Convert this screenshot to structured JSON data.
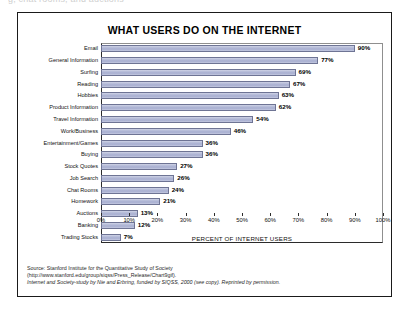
{
  "page": {
    "top_cut_text": "g, chat rooms, and auctions"
  },
  "figure": {
    "title": "WHAT USERS DO ON THE INTERNET",
    "x_axis_title": "PERCENT OF INTERNET USERS",
    "source_lines": [
      "Source: Stanford Institute for the Quantitative Study of Society",
      "(http://www.stanford.edu/group/siqss/Press_Release/Chart9gif).",
      "Internet and Society-study by Nie and Erbring, funded by SIQSS, 2000 (see copy). Reprinted by permission."
    ],
    "colors": {
      "bar_fill": "#a7aed0",
      "bar_border": "#6e7494",
      "frame": "#1a1a1a",
      "axis": "#2b2b2b"
    }
  },
  "chart_data": {
    "type": "bar",
    "orientation": "horizontal",
    "title": "WHAT USERS DO ON THE INTERNET",
    "xlabel": "PERCENT OF INTERNET USERS",
    "ylabel": "",
    "xlim": [
      0,
      100
    ],
    "xticks": [
      "0%",
      "10%",
      "20%",
      "30%",
      "40%",
      "50%",
      "60%",
      "70%",
      "80%",
      "90%",
      "100%"
    ],
    "grid": false,
    "legend": null,
    "value_suffix": "%",
    "categories": [
      "Email",
      "General Information",
      "Surfing",
      "Reading",
      "Hobbies",
      "Product Information",
      "Travel Information",
      "Work/Business",
      "Entertainment/Games",
      "Buying",
      "Stock Quotes",
      "Job Search",
      "Chat Rooms",
      "Homework",
      "Auctions",
      "Banking",
      "Trading Stocks"
    ],
    "values": [
      90,
      77,
      69,
      67,
      63,
      62,
      54,
      46,
      36,
      36,
      27,
      26,
      24,
      21,
      13,
      12,
      7
    ],
    "labels": [
      "90%",
      "77%",
      "69%",
      "67%",
      "63%",
      "62%",
      "54%",
      "46%",
      "36%",
      "36%",
      "27%",
      "26%",
      "24%",
      "21%",
      "13%",
      "12%",
      "7%"
    ]
  }
}
